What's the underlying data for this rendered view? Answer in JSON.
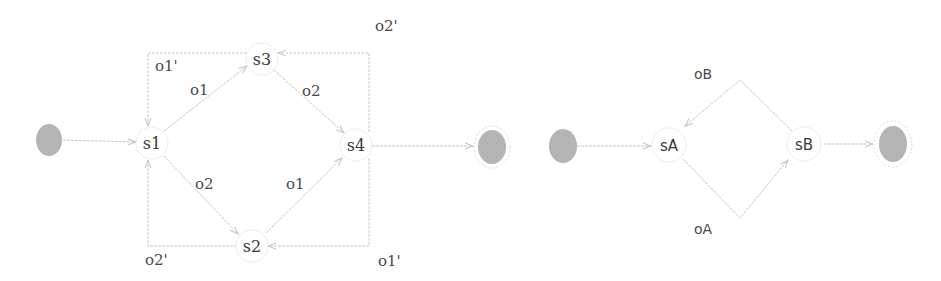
{
  "colors": {
    "edge": "#c8c8c8",
    "pseudo_state_fill": "#b4b4b4",
    "state_border": "#e4e4e4",
    "text": "#3a3a3a"
  },
  "diagram_left": {
    "title": "State machine with four states",
    "initial": {
      "x": 49,
      "y": 140
    },
    "final": {
      "x": 492,
      "y": 147
    },
    "states": [
      {
        "id": "s1",
        "label": "s1",
        "x": 152,
        "y": 143
      },
      {
        "id": "s2",
        "label": "s2",
        "x": 252,
        "y": 246
      },
      {
        "id": "s3",
        "label": "s3",
        "x": 262,
        "y": 59
      },
      {
        "id": "s4",
        "label": "s4",
        "x": 356,
        "y": 145
      }
    ],
    "transitions": [
      {
        "from": "initial",
        "to": "s1",
        "label": ""
      },
      {
        "from": "s1",
        "to": "s3",
        "label": "o1"
      },
      {
        "from": "s1",
        "to": "s2",
        "label": "o2"
      },
      {
        "from": "s3",
        "to": "s4",
        "label": "o2"
      },
      {
        "from": "s2",
        "to": "s4",
        "label": "o1"
      },
      {
        "from": "s3",
        "to": "s1",
        "label": "o1'"
      },
      {
        "from": "s2",
        "to": "s1",
        "label": "o2'"
      },
      {
        "from": "s4",
        "to": "s3",
        "label": "o2'"
      },
      {
        "from": "s4",
        "to": "s2",
        "label": "o1'"
      },
      {
        "from": "s4",
        "to": "final",
        "label": ""
      }
    ],
    "edge_labels": {
      "s3_to_s1": "o1'",
      "s1_to_s3": "o1",
      "s3_to_s4": "o2",
      "s4_to_s3": "o2'",
      "s1_to_s2": "o2",
      "s2_to_s4": "o1",
      "s2_to_s1": "o2'",
      "s4_to_s2": "o1'"
    }
  },
  "diagram_right": {
    "title": "State machine with two states",
    "initial": {
      "x": 563,
      "y": 146
    },
    "final": {
      "x": 893,
      "y": 144
    },
    "states": [
      {
        "id": "sA",
        "label": "sA",
        "x": 669,
        "y": 145
      },
      {
        "id": "sB",
        "label": "sB",
        "x": 804,
        "y": 144
      }
    ],
    "transitions": [
      {
        "from": "initial",
        "to": "sA",
        "label": ""
      },
      {
        "from": "sA",
        "to": "sB",
        "label": "oA"
      },
      {
        "from": "sB",
        "to": "sA",
        "label": "oB"
      },
      {
        "from": "sB",
        "to": "final",
        "label": ""
      }
    ],
    "edge_labels": {
      "sB_to_sA": "oB",
      "sA_to_sB": "oA"
    }
  }
}
